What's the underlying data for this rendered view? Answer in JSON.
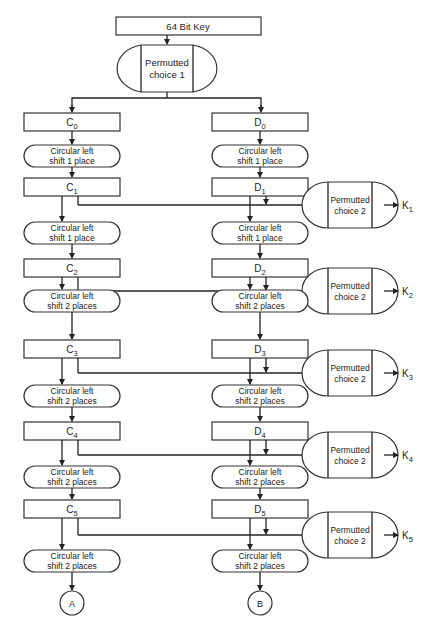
{
  "key_box": {
    "label": "64 Bit Key"
  },
  "pc1": {
    "line1": "Permutted",
    "line2": "choice 1"
  },
  "registers_c": [
    {
      "base": "C",
      "sub": "0"
    },
    {
      "base": "C",
      "sub": "1"
    },
    {
      "base": "C",
      "sub": "2"
    },
    {
      "base": "C",
      "sub": "3"
    },
    {
      "base": "C",
      "sub": "4"
    },
    {
      "base": "C",
      "sub": "5"
    }
  ],
  "registers_d": [
    {
      "base": "D",
      "sub": "0"
    },
    {
      "base": "D",
      "sub": "1"
    },
    {
      "base": "D",
      "sub": "2"
    },
    {
      "base": "D",
      "sub": "3"
    },
    {
      "base": "D",
      "sub": "4"
    },
    {
      "base": "D",
      "sub": "5"
    }
  ],
  "shifts": [
    {
      "line1": "Circular left",
      "line2": "shift 1 place"
    },
    {
      "line1": "Circular left",
      "line2": "shift 1 place"
    },
    {
      "line1": "Circular left",
      "line2": "shift 2 places"
    },
    {
      "line1": "Circular left",
      "line2": "shift 2 places"
    },
    {
      "line1": "Circular left",
      "line2": "shift 2 places"
    },
    {
      "line1": "Circular left",
      "line2": "shift 2 places"
    }
  ],
  "pc2": [
    {
      "line1": "Permutted",
      "line2": "choice 2",
      "output_base": "K",
      "output_sub": "1"
    },
    {
      "line1": "Permutted",
      "line2": "choice 2",
      "output_base": "K",
      "output_sub": "2"
    },
    {
      "line1": "Permutted",
      "line2": "choice 2",
      "output_base": "K",
      "output_sub": "3"
    },
    {
      "line1": "Permutted",
      "line2": "choice 2",
      "output_base": "K",
      "output_sub": "4"
    },
    {
      "line1": "Permutted",
      "line2": "choice 2",
      "output_base": "K",
      "output_sub": "5"
    }
  ],
  "connectors": {
    "left": "A",
    "right": "B"
  }
}
